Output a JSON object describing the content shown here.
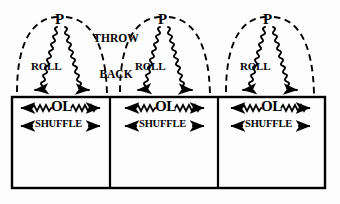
{
  "figure": {
    "title_text": "",
    "background_color": "#fdfdfd",
    "ink_color": "#000000",
    "width": 340,
    "height": 204
  },
  "annotations": {
    "throw_back": {
      "line1": "THROW",
      "line2": "BACK"
    },
    "peak_label": "P",
    "roll_label": "ROLL",
    "ol_label": "OL",
    "shuffle_label": "SHUFFLE"
  },
  "cells": [
    {
      "index": 1,
      "peak_label": "P",
      "roll_label": "ROLL",
      "ol_label": "OL",
      "shuffle_label": "SHUFFLE",
      "peak_x": 60,
      "left_x": 12,
      "right_x": 110
    },
    {
      "index": 2,
      "peak_label": "P",
      "roll_label": "ROLL",
      "ol_label": "OL",
      "shuffle_label": "SHUFFLE",
      "peak_x": 163,
      "left_x": 110,
      "right_x": 218
    },
    {
      "index": 3,
      "peak_label": "P",
      "roll_label": "ROLL",
      "ol_label": "OL",
      "shuffle_label": "SHUFFLE",
      "peak_x": 268,
      "left_x": 218,
      "right_x": 325
    }
  ],
  "box": {
    "left": 12,
    "right": 325,
    "top": 97,
    "bottom": 188,
    "divider_1_x": 110,
    "divider_2_x": 218,
    "stroke_width": 2.2
  }
}
